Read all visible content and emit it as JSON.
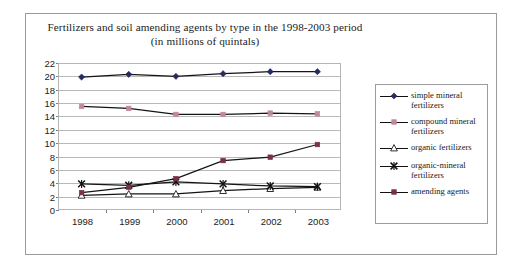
{
  "chart_data": {
    "type": "line",
    "title": "Fertilizers and soil amending agents by type in the 1998-2003 period",
    "subtitle": "(in millions of quintals)",
    "xlabel": "",
    "ylabel": "",
    "categories": [
      "1998",
      "1999",
      "2000",
      "2001",
      "2002",
      "2003"
    ],
    "ylim": [
      0,
      22
    ],
    "ytick_step": 2,
    "yticks": [
      "22",
      "20",
      "18",
      "16",
      "14",
      "12",
      "10",
      "8",
      "6",
      "4",
      "2",
      "0"
    ],
    "grid": true,
    "legend_position": "right",
    "series": [
      {
        "name": "simple mineral fertilizers",
        "marker": "diamond",
        "color": "#262a5e",
        "values": [
          19.9,
          20.3,
          20.0,
          20.4,
          20.7,
          20.7
        ]
      },
      {
        "name": "compound mineral fertilizers",
        "marker": "square",
        "color": "#c08898",
        "values": [
          15.5,
          15.2,
          14.3,
          14.3,
          14.5,
          14.4
        ]
      },
      {
        "name": "organic fertilizers",
        "marker": "triangle-open",
        "color": "#1a1a1a",
        "values": [
          2.2,
          2.4,
          2.4,
          2.9,
          3.2,
          3.4
        ]
      },
      {
        "name": "organic-mineral fertilizers",
        "marker": "cross",
        "color": "#111111",
        "values": [
          3.9,
          3.7,
          4.2,
          3.9,
          3.6,
          3.5
        ]
      },
      {
        "name": "amending agents",
        "marker": "square",
        "color": "#7b3048",
        "values": [
          2.6,
          3.4,
          4.7,
          7.4,
          7.9,
          9.8
        ]
      }
    ]
  },
  "legend": {
    "items": [
      {
        "label": "simple mineral fertilizers"
      },
      {
        "label": "compound mineral fertilizers"
      },
      {
        "label": "organic fertilizers"
      },
      {
        "label": "organic-mineral fertilizers"
      },
      {
        "label": "amending agents"
      }
    ]
  },
  "colors": {
    "simple_mineral": "#262a5e",
    "compound_mineral": "#c08898",
    "organic": "#ffffff",
    "organic_mineral": "#111111",
    "amending": "#7b3048",
    "gridline": "#b9b9b9",
    "axis": "#8f8f8f",
    "frame": "#9a9a9a"
  }
}
